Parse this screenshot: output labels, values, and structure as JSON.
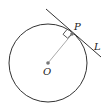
{
  "diagram": {
    "title": "",
    "labels": {
      "center": "O",
      "point": "P",
      "tangent": "L"
    },
    "colors": {
      "circle": "#333333",
      "tangent_line": "#333333",
      "radius": "#aaaaaa",
      "points": "#777777",
      "right_angle": "#444444"
    },
    "geometry": {
      "circle": {
        "cx": 48,
        "cy": 63,
        "r": 39
      },
      "center_point": {
        "x": 48,
        "y": 63
      },
      "tangent_point": {
        "x": 72,
        "y": 33
      },
      "tangent_line": {
        "x1": 46,
        "y1": 9,
        "x2": 101,
        "y2": 57
      },
      "right_angle_marker": true
    }
  }
}
